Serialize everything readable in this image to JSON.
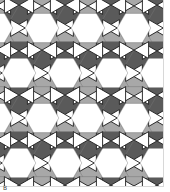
{
  "figure": {
    "panel_label": "B",
    "tiling_type": "rhombitrihexagonal (3.4.6.4)",
    "colors": {
      "hexagon": "#ffffff",
      "square_dark": "#5a5a5a",
      "square_light": "#a8a8a8",
      "triangle": "#ffffff",
      "triangle_outline": "#1a1a1a",
      "edge": "#777777",
      "frame": "#d8d8d8"
    },
    "geometry": {
      "hex_spacing_x": 46,
      "hex_spacing_y": 45,
      "edge_length": 16.8,
      "origin_x": 42,
      "origin_y": 28
    }
  }
}
